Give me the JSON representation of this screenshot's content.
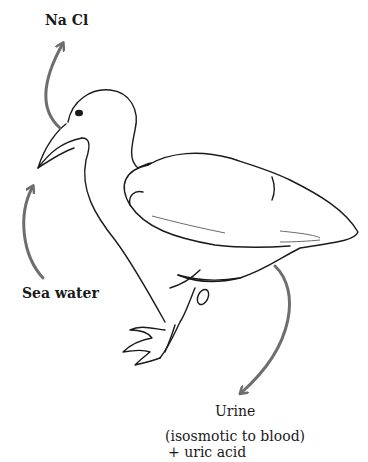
{
  "diagram": {
    "labels": {
      "nacl": "Na Cl",
      "sea_water": "Sea water",
      "urine": "Urine",
      "urine_note_1": "(isosmotic to blood)",
      "urine_note_2": "+ uric acid"
    },
    "arrows": [
      {
        "name": "nacl-out-arrow",
        "from": "nostril",
        "to": "Na Cl"
      },
      {
        "name": "seawater-in-arrow",
        "from": "Sea water",
        "to": "beak"
      },
      {
        "name": "urine-out-arrow",
        "from": "cloaca",
        "to": "Urine"
      }
    ],
    "colors": {
      "outline": "#1a1a1a",
      "arrow": "#6e6e6e",
      "background": "#ffffff"
    }
  }
}
